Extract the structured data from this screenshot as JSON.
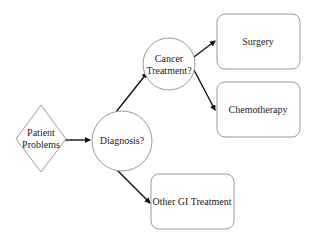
{
  "diagram": {
    "nodes": {
      "patient": {
        "line1": "Patient",
        "line2": "Problems",
        "shape": "diamond"
      },
      "diagnosis": {
        "label": "Diagnosis?",
        "shape": "circle"
      },
      "cancer": {
        "line1": "Cancer",
        "line2": "Treatment?",
        "shape": "circle"
      },
      "surgery": {
        "label": "Surgery",
        "shape": "rounded-rect"
      },
      "chemo": {
        "label": "Chemotherapy",
        "shape": "rounded-rect"
      },
      "other": {
        "label": "Other GI Treatment",
        "shape": "rounded-rect"
      }
    },
    "edges": [
      {
        "from": "patient",
        "to": "diagnosis"
      },
      {
        "from": "diagnosis",
        "to": "cancer"
      },
      {
        "from": "diagnosis",
        "to": "other"
      },
      {
        "from": "cancer",
        "to": "surgery"
      },
      {
        "from": "cancer",
        "to": "chemo"
      }
    ],
    "colors": {
      "node_stroke": "#9a9a9a",
      "edge": "#111111",
      "text": "#222222"
    }
  }
}
